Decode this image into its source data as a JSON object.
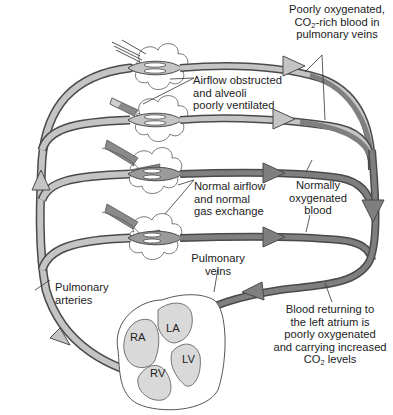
{
  "diagram": {
    "colors": {
      "artery_fill": "#c4c4c4",
      "vein_fill": "#7f7f7f",
      "outline": "#4a4a4a",
      "heart_chamber": "#d9d9d9",
      "text": "#222222"
    },
    "labels": {
      "poorly_oxygenated": {
        "lines": [
          "Poorly oxygenated,",
          "CO",
          "-rich blood in",
          "pulmonary veins"
        ],
        "sub": "2"
      },
      "airflow_obstructed": {
        "lines": [
          "Airflow obstructed",
          "and alveoli",
          "poorly ventilated"
        ]
      },
      "normal_airflow": {
        "lines": [
          "Normal airflow",
          "and normal",
          "gas exchange"
        ]
      },
      "normally_oxygenated": {
        "lines": [
          "Normally",
          "oxygenated",
          "blood"
        ]
      },
      "pulmonary_veins": {
        "lines": [
          "Pulmonary",
          "veins"
        ]
      },
      "pulmonary_arteries": {
        "lines": [
          "Pulmonary",
          "arteries"
        ]
      },
      "blood_returning": {
        "lines": [
          "Blood returning to",
          "the left atrium is",
          "poorly oxygenated",
          "and carrying increased",
          "CO",
          " levels"
        ],
        "sub": "2"
      }
    },
    "heart": {
      "chambers": [
        "RA",
        "LA",
        "LV",
        "RV"
      ]
    }
  }
}
